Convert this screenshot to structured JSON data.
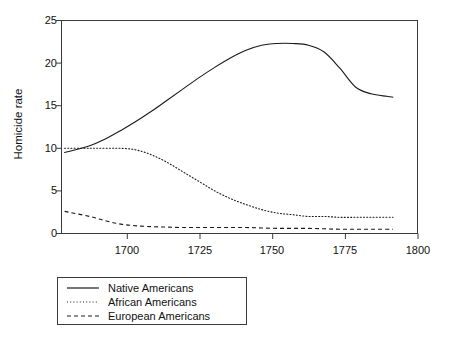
{
  "chart_data": {
    "type": "line",
    "title": "",
    "xlabel": "",
    "ylabel": "Homicide rate",
    "xlim": [
      1686,
      1800
    ],
    "ylim": [
      0,
      25
    ],
    "grid": false,
    "legend_position": "below-left",
    "x_ticks": [
      1700,
      1725,
      1750,
      1775,
      1800
    ],
    "y_ticks": [
      0,
      5,
      10,
      15,
      20,
      25
    ],
    "series": [
      {
        "name": "Native Americans",
        "style": "solid",
        "color": "#1a1a1a",
        "x": [
          1687,
          1695,
          1700,
          1705,
          1710,
          1715,
          1720,
          1725,
          1730,
          1735,
          1740,
          1745,
          1750,
          1755,
          1760,
          1765,
          1770,
          1775,
          1780,
          1785,
          1790,
          1792
        ],
        "values": [
          9.5,
          10.3,
          11.1,
          12.1,
          13.2,
          14.4,
          15.7,
          17.0,
          18.3,
          19.5,
          20.6,
          21.5,
          22.1,
          22.3,
          22.3,
          22.1,
          21.3,
          19.4,
          17.2,
          16.4,
          16.1,
          16.0
        ]
      },
      {
        "name": "African Americans",
        "style": "dotted",
        "color": "#1a1a1a",
        "x": [
          1687,
          1695,
          1700,
          1705,
          1710,
          1715,
          1720,
          1725,
          1730,
          1735,
          1740,
          1745,
          1750,
          1755,
          1760,
          1765,
          1770,
          1775,
          1780,
          1785,
          1790,
          1792
        ],
        "values": [
          10.0,
          10.0,
          10.0,
          10.0,
          9.8,
          9.2,
          8.3,
          7.2,
          6.1,
          5.0,
          4.1,
          3.4,
          2.8,
          2.4,
          2.2,
          2.0,
          2.0,
          1.9,
          1.9,
          1.9,
          1.9,
          1.9
        ]
      },
      {
        "name": "European Americans",
        "style": "dashed",
        "color": "#1a1a1a",
        "x": [
          1687,
          1695,
          1700,
          1705,
          1710,
          1715,
          1720,
          1725,
          1730,
          1735,
          1740,
          1745,
          1750,
          1755,
          1760,
          1765,
          1770,
          1775,
          1780,
          1785,
          1790,
          1792
        ],
        "values": [
          2.6,
          2.0,
          1.5,
          1.1,
          0.9,
          0.8,
          0.75,
          0.7,
          0.7,
          0.7,
          0.7,
          0.7,
          0.65,
          0.6,
          0.6,
          0.6,
          0.55,
          0.5,
          0.5,
          0.5,
          0.5,
          0.5
        ]
      }
    ]
  },
  "axes": {
    "y_title": "Homicide rate",
    "y_tick_labels": [
      "25",
      "20",
      "15",
      "10",
      "5",
      "0"
    ],
    "x_tick_labels": [
      "1700",
      "1725",
      "1750",
      "1775",
      "1800"
    ]
  },
  "legend": {
    "items": [
      {
        "label": "Native Americans",
        "style": "solid"
      },
      {
        "label": "African Americans",
        "style": "dotted"
      },
      {
        "label": "European Americans",
        "style": "dashed"
      }
    ]
  },
  "colors": {
    "line": "#1a1a1a",
    "axis": "#3a3a3a",
    "background": "#ffffff"
  }
}
